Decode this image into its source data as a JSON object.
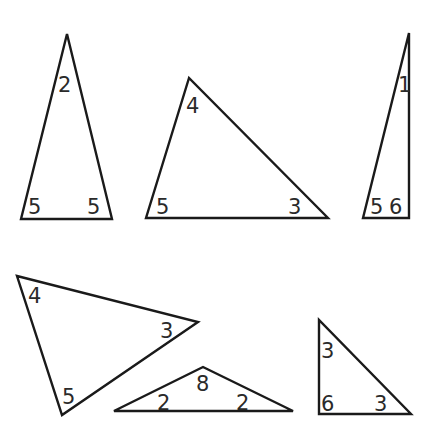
{
  "diagram": {
    "stroke_color": "#1a1a1a",
    "text_color": "#2a2a2a",
    "background": "#ffffff",
    "triangles": [
      {
        "id": "t1",
        "points": "67,34 21,219 112,219",
        "labels": [
          {
            "text": "2",
            "x": 58,
            "y": 92
          },
          {
            "text": "5",
            "x": 28,
            "y": 214
          },
          {
            "text": "5",
            "x": 87,
            "y": 214
          }
        ]
      },
      {
        "id": "t2",
        "points": "189,78 146,218 328,218",
        "labels": [
          {
            "text": "4",
            "x": 186,
            "y": 113
          },
          {
            "text": "5",
            "x": 156,
            "y": 214
          },
          {
            "text": "3",
            "x": 288,
            "y": 214
          }
        ]
      },
      {
        "id": "t3",
        "points": "409,33 363,218 409,218",
        "labels": [
          {
            "text": "1",
            "x": 398,
            "y": 92
          },
          {
            "text": "5",
            "x": 370,
            "y": 214
          },
          {
            "text": "6",
            "x": 389,
            "y": 214
          }
        ]
      },
      {
        "id": "t4",
        "points": "17,276 198,322 62,415",
        "labels": [
          {
            "text": "4",
            "x": 28,
            "y": 303
          },
          {
            "text": "3",
            "x": 160,
            "y": 338
          },
          {
            "text": "5",
            "x": 62,
            "y": 404
          }
        ]
      },
      {
        "id": "t5",
        "points": "114,411 203,367 293,411",
        "labels": [
          {
            "text": "2",
            "x": 157,
            "y": 410
          },
          {
            "text": "8",
            "x": 196,
            "y": 391
          },
          {
            "text": "2",
            "x": 236,
            "y": 410
          }
        ]
      },
      {
        "id": "t6",
        "points": "319,320 319,414 411,414",
        "labels": [
          {
            "text": "3",
            "x": 321,
            "y": 358
          },
          {
            "text": "6",
            "x": 321,
            "y": 411
          },
          {
            "text": "3",
            "x": 374,
            "y": 411
          }
        ]
      }
    ]
  }
}
